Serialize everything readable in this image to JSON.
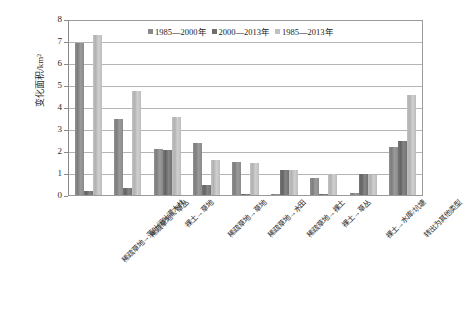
{
  "chart_data": {
    "type": "bar",
    "title": "",
    "xlabel": "",
    "ylabel": "变化面积/km²",
    "ylim": [
      0,
      8
    ],
    "yticks": [
      "0",
      "1",
      "2",
      "3",
      "4",
      "5",
      "6",
      "7",
      "8"
    ],
    "grid": true,
    "legend_position": "top-center",
    "categories": [
      "稀疏草地→落叶阔叶灌木林",
      "稀疏草地→草丛",
      "裸土→草地",
      "稀疏草地→草地",
      "稀疏草地→水田",
      "稀疏草地→裸土",
      "裸土→草丛",
      "裸土→水库/坑塘",
      "转出为其他类型"
    ],
    "series": [
      {
        "name": "1985—2000年",
        "color": "#8a8a8a",
        "values": [
          7.0,
          3.5,
          2.1,
          2.4,
          1.5,
          0.05,
          0.8,
          0.1,
          2.2
        ]
      },
      {
        "name": "2000—2013年",
        "color": "#6e6e6e",
        "values": [
          0.2,
          0.3,
          2.05,
          0.45,
          0.05,
          1.15,
          0.05,
          0.95,
          2.5
        ]
      },
      {
        "name": "1985—2013年",
        "color": "#c0c0c0",
        "values": [
          7.35,
          4.8,
          3.6,
          1.6,
          1.45,
          1.15,
          0.95,
          0.9,
          4.6
        ]
      }
    ]
  },
  "artifacts": {
    "corner_mark": ""
  }
}
